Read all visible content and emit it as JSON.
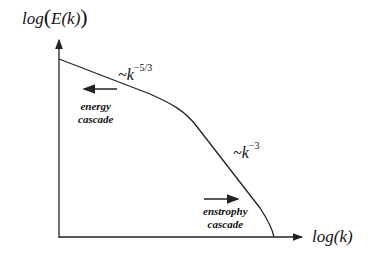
{
  "diagram": {
    "y_axis_label": "log(E(k))",
    "y_axis_prefix": "log",
    "y_axis_inner": "E(k)",
    "x_axis_label": "log(k)",
    "power_law_1": {
      "base": "~k",
      "exponent": "−5/3"
    },
    "power_law_2": {
      "base": "~k",
      "exponent": "−3"
    },
    "energy_cascade": {
      "line1": "energy",
      "line2": "cascade",
      "direction": "left"
    },
    "enstrophy_cascade": {
      "line1": "enstrophy",
      "line2": "cascade",
      "direction": "right"
    },
    "line_color": "#222222"
  }
}
